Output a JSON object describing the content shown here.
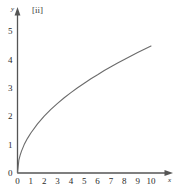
{
  "figure": {
    "part_label": "[ii]",
    "background_color": "#ffffff",
    "axis_color": "#555555",
    "curve_color": "#6b6b6b",
    "text_color": "#2b2b2b"
  },
  "chart_data": {
    "type": "line",
    "title": "[ii]",
    "xlabel": "x",
    "ylabel": "y",
    "xlim": [
      0,
      10.6
    ],
    "ylim": [
      0,
      5.3
    ],
    "grid": false,
    "legend": null,
    "x_ticks": [
      0,
      1,
      2,
      3,
      4,
      5,
      6,
      7,
      8,
      9,
      10
    ],
    "x_tick_labels": [
      "0",
      "1",
      "2",
      "3",
      "4",
      "5",
      "6",
      "7",
      "8",
      "9",
      "10"
    ],
    "y_ticks": [
      0,
      1,
      2,
      3,
      4,
      5
    ],
    "y_tick_labels": [
      "0",
      "1",
      "2",
      "3",
      "4",
      "5"
    ],
    "series": [
      {
        "name": "y = sqrt(2x)",
        "x": [
          0,
          0.1,
          0.2,
          0.3,
          0.5,
          0.75,
          1,
          1.5,
          2,
          2.5,
          3,
          3.5,
          4,
          4.5,
          5,
          5.5,
          6,
          6.5,
          7,
          7.5,
          8,
          8.5,
          9,
          9.5,
          10
        ],
        "values": [
          0,
          0.45,
          0.63,
          0.77,
          1.0,
          1.22,
          1.41,
          1.73,
          2.0,
          2.24,
          2.45,
          2.65,
          2.83,
          3.0,
          3.16,
          3.32,
          3.46,
          3.61,
          3.74,
          3.87,
          4.0,
          4.12,
          4.24,
          4.36,
          4.47
        ]
      }
    ]
  }
}
